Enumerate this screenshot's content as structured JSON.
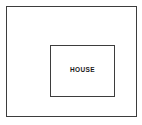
{
  "diagram": {
    "type": "site-plan",
    "background_color": "#ffffff",
    "line_color": "#3d3d3d",
    "text_color": "#1a1a1a",
    "outer_region": {
      "name": "lot-boundary",
      "label": "",
      "fill": "#ffffff"
    },
    "inner_region": {
      "name": "house-footprint",
      "label": "HOUSE",
      "fill": "#ffffff"
    }
  }
}
